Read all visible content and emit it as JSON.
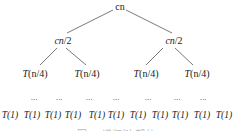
{
  "diagram": {
    "root": {
      "label": "cn"
    },
    "level1": [
      {
        "label_italic": "cn",
        "label_rest": "/2"
      },
      {
        "label_italic": "cn",
        "label_rest": "/2"
      }
    ],
    "level2": [
      {
        "label_pre": "T",
        "label_mid": "(n",
        "label_rest": "/4)"
      },
      {
        "label_pre": "T",
        "label_mid": "(n",
        "label_rest": "/4)"
      },
      {
        "label_pre": "T",
        "label_mid": "(n",
        "label_rest": "/4)"
      },
      {
        "label_pre": "T",
        "label_mid": "(n",
        "label_rest": "/4)"
      }
    ],
    "ellipsis": [
      "...",
      "...",
      "...",
      "...",
      "...",
      "...",
      "..."
    ],
    "leaves": [
      "T(1)",
      "T(1)",
      "T(1)",
      "T(1)",
      "T(1)",
      "T(1)",
      "T(1)",
      "T(1)",
      "T(1)",
      "T(1)",
      "T(1)"
    ],
    "caption": "图 — 递归树(部分)"
  }
}
